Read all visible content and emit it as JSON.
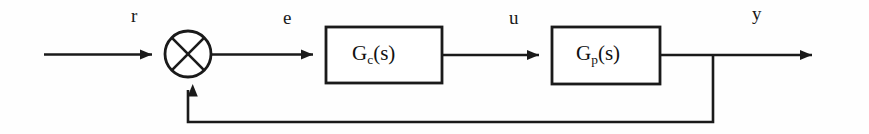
{
  "diagram": {
    "kind": "feedback-control-block-diagram",
    "background_color": "#fefefe",
    "line_color": "#1a1a1a",
    "text_color": "#111111",
    "width": 869,
    "height": 134
  },
  "signals": {
    "reference": {
      "label": "r",
      "x": 131,
      "y": 6
    },
    "error": {
      "label": "e",
      "x": 283,
      "y": 8
    },
    "control": {
      "label": "u",
      "x": 509,
      "y": 8
    },
    "output": {
      "label": "y",
      "x": 752,
      "y": 4
    }
  },
  "summing_junction": {
    "name": "summing-junction",
    "shape": "circle-with-x",
    "center_x": 188,
    "center_y": 54,
    "radius": 23,
    "inputs": [
      "reference",
      "feedback"
    ]
  },
  "blocks": [
    {
      "name": "controller-block",
      "gain_text": "G",
      "subscript": "c",
      "argument": "(s)",
      "full_label": "Gc(s)",
      "x": 326,
      "y": 27,
      "width": 116,
      "height": 56
    },
    {
      "name": "plant-block",
      "gain_text": "G",
      "subscript": "p",
      "argument": "(s)",
      "full_label": "Gp(s)",
      "x": 552,
      "y": 27,
      "width": 108,
      "height": 57
    }
  ],
  "connections": [
    {
      "name": "reference-input-line",
      "from": "left-edge",
      "to": "summing-junction",
      "arrow": true
    },
    {
      "name": "error-line",
      "from": "summing-junction",
      "to": "controller-block",
      "arrow": true
    },
    {
      "name": "control-line",
      "from": "controller-block",
      "to": "plant-block",
      "arrow": true
    },
    {
      "name": "output-line",
      "from": "plant-block",
      "to": "right-edge",
      "arrow": true
    },
    {
      "name": "feedback-path",
      "from": "output-tap",
      "to": "summing-junction",
      "arrow": true
    }
  ]
}
